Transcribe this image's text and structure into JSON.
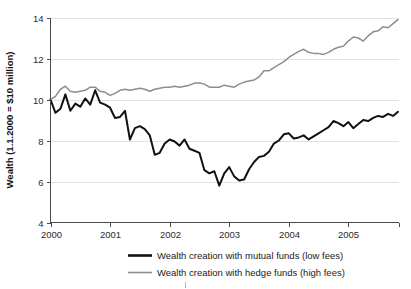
{
  "chart_data": {
    "type": "line",
    "title": "",
    "subtitle": "",
    "xlabel": "",
    "ylabel": "Wealth (1.1.2000 = $10 million)",
    "xlim": [
      2000.0,
      2005.85
    ],
    "ylim": [
      4,
      14
    ],
    "xticks": [
      2000,
      2001,
      2002,
      2003,
      2004,
      2005
    ],
    "xticklabels": [
      "2000",
      "2001",
      "2002",
      "2003",
      "2004",
      "2005"
    ],
    "yticks": [
      4,
      6,
      8,
      10,
      12,
      14
    ],
    "yticklabels": [
      "4",
      "6",
      "8",
      "10",
      "12",
      "14"
    ],
    "grid": "horizontal",
    "legend_position": "bottom",
    "colors": {
      "mutual_funds": "#111111",
      "hedge_funds": "#8d8d8d",
      "gridline": "#e2e2e2",
      "axis": "#4a4a4a",
      "background": "#ffffff"
    },
    "x": [
      2000.0,
      2000.083,
      2000.167,
      2000.25,
      2000.333,
      2000.417,
      2000.5,
      2000.583,
      2000.667,
      2000.75,
      2000.833,
      2000.917,
      2001.0,
      2001.083,
      2001.167,
      2001.25,
      2001.333,
      2001.417,
      2001.5,
      2001.583,
      2001.667,
      2001.75,
      2001.833,
      2001.917,
      2002.0,
      2002.083,
      2002.167,
      2002.25,
      2002.333,
      2002.417,
      2002.5,
      2002.583,
      2002.667,
      2002.75,
      2002.833,
      2002.917,
      2003.0,
      2003.083,
      2003.167,
      2003.25,
      2003.333,
      2003.417,
      2003.5,
      2003.583,
      2003.667,
      2003.75,
      2003.833,
      2003.917,
      2004.0,
      2004.083,
      2004.167,
      2004.25,
      2004.333,
      2004.417,
      2004.5,
      2004.583,
      2004.667,
      2004.75,
      2004.833,
      2004.917,
      2005.0,
      2005.083,
      2005.167,
      2005.25,
      2005.333,
      2005.417,
      2005.5,
      2005.583,
      2005.667,
      2005.75,
      2005.833
    ],
    "series": [
      {
        "name": "Wealth creation with mutual funds (low fees)",
        "legend_label": "Wealth creation with mutual funds (low fees)",
        "color": "#111111",
        "linewidth": 2.0,
        "values": [
          10.0,
          9.35,
          9.55,
          10.25,
          9.45,
          9.8,
          9.65,
          10.05,
          9.75,
          10.45,
          9.85,
          9.75,
          9.6,
          9.1,
          9.15,
          9.45,
          8.05,
          8.6,
          8.7,
          8.55,
          8.25,
          7.3,
          7.4,
          7.85,
          8.05,
          7.95,
          7.75,
          8.05,
          7.6,
          7.5,
          7.4,
          6.55,
          6.4,
          6.5,
          5.8,
          6.4,
          6.7,
          6.25,
          6.05,
          6.1,
          6.6,
          6.95,
          7.2,
          7.25,
          7.45,
          7.85,
          8.0,
          8.3,
          8.35,
          8.1,
          8.15,
          8.25,
          8.05,
          8.2,
          8.35,
          8.5,
          8.65,
          8.95,
          8.85,
          8.7,
          8.9,
          8.6,
          8.8,
          9.0,
          8.95,
          9.1,
          9.2,
          9.15,
          9.3,
          9.2,
          9.4
        ]
      },
      {
        "name": "Wealth creation with hedge funds (high fees)",
        "legend_label": "Wealth creation with hedge funds (high fees)",
        "color": "#8d8d8d",
        "linewidth": 1.5,
        "values": [
          10.0,
          10.15,
          10.5,
          10.65,
          10.4,
          10.35,
          10.4,
          10.45,
          10.6,
          10.6,
          10.4,
          10.35,
          10.2,
          10.3,
          10.45,
          10.5,
          10.45,
          10.5,
          10.55,
          10.5,
          10.4,
          10.5,
          10.55,
          10.6,
          10.6,
          10.65,
          10.6,
          10.65,
          10.7,
          10.8,
          10.8,
          10.75,
          10.6,
          10.6,
          10.6,
          10.7,
          10.65,
          10.6,
          10.75,
          10.85,
          10.9,
          10.95,
          11.1,
          11.4,
          11.4,
          11.55,
          11.7,
          11.85,
          12.05,
          12.2,
          12.35,
          12.45,
          12.3,
          12.25,
          12.25,
          12.2,
          12.3,
          12.45,
          12.55,
          12.6,
          12.85,
          13.05,
          13.0,
          12.85,
          13.1,
          13.3,
          13.35,
          13.55,
          13.5,
          13.7,
          13.9
        ]
      }
    ]
  },
  "legend": {
    "items": [
      {
        "label": "Wealth creation with mutual funds (low fees)",
        "color": "#111111"
      },
      {
        "label": "Wealth creation with hedge funds (high fees)",
        "color": "#8d8d8d"
      }
    ]
  },
  "axes": {
    "y_title": "Wealth (1.1.2000 = $10 million)",
    "y_labels": [
      "14",
      "12",
      "10",
      "8",
      "6",
      "4"
    ],
    "x_labels": [
      "2000",
      "2001",
      "2002",
      "2003",
      "2004",
      "2005"
    ]
  }
}
